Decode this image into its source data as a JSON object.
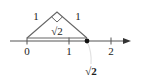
{
  "diagram": {
    "triangle": {
      "leg_left_label": "1",
      "leg_right_label": "1",
      "hypotenuse_label": "√2",
      "right_angle": true
    },
    "number_line": {
      "ticks": [
        {
          "value": 0,
          "label": "0"
        },
        {
          "value": 1,
          "label": "1"
        },
        {
          "value": 2,
          "label": "2"
        }
      ],
      "arrow": "right"
    },
    "point": {
      "label": "√2",
      "value": 1.414
    },
    "colors": {
      "line": "#555555",
      "text": "#222222",
      "point": "#111111",
      "arc": "#dddddd"
    }
  }
}
